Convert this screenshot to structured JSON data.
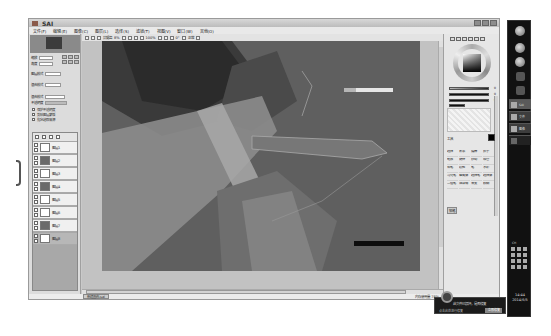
{
  "window": {
    "app_name": "SAI",
    "menu": [
      "文件(F)",
      "编辑(E)",
      "图像(C)",
      "图层(L)",
      "选择(S)",
      "滤镜(T)",
      "视图(V)",
      "窗口(W)",
      "其他(O)"
    ]
  },
  "canvas_toolbar": {
    "items": [
      "抗锯齿",
      "8%",
      "100%",
      "0°",
      "正常"
    ]
  },
  "left_panel": {
    "zoom_label": "缩放",
    "zoom_value": "100%",
    "angle_label": "角度",
    "angle_value": "0°",
    "mode_label1": "图层模式",
    "mode_value1": "正常",
    "mode_label2": "混合模式",
    "mode_value2": "正常",
    "blend_label": "混合模式",
    "blend_value": "正常",
    "opacity_label": "不透明度",
    "opacity_value": "100%",
    "checks": [
      "保护不透明度",
      "剪贴图层蒙版",
      "指定选取来源"
    ],
    "layers": [
      {
        "name": "图层1",
        "sub": "正常"
      },
      {
        "name": "图层2",
        "sub": "正常"
      },
      {
        "name": "图层3",
        "sub": "正常"
      },
      {
        "name": "图层4",
        "sub": "正常"
      },
      {
        "name": "图层5",
        "sub": "正常"
      },
      {
        "name": "图层6",
        "sub": "正常"
      },
      {
        "name": "图层7",
        "sub": "正常"
      },
      {
        "name": "图层8",
        "sub": "正常"
      }
    ]
  },
  "right_panel": {
    "slider_values": [
      "0",
      "0",
      "0"
    ],
    "tool_header": "工具",
    "tools": [
      "选择",
      "套索",
      "魔棒",
      "抓手",
      "缩放",
      "旋转",
      "移动",
      "吸管",
      "铅笔",
      "喷枪",
      "笔",
      "水彩",
      "马克笔",
      "橡皮擦",
      "选择笔",
      "选择擦",
      "二值笔",
      "油漆桶",
      "渐变",
      "模糊"
    ],
    "tag_label": "铅笔"
  },
  "status_bar": {
    "tab_label": "新建画布.sai",
    "memory": "内存使用量 78%"
  },
  "taskbar": {
    "tasks": [
      "SAI",
      "文件",
      "图像"
    ],
    "lang": "CH",
    "clock_time": "14:44",
    "clock_date": "2014/6/5"
  },
  "notification": {
    "title": "此文件已损坏，是否修复",
    "subtitle": "点击此处进行修复",
    "button": "立即修复"
  },
  "colors": {
    "canvas_bg": "#5e5e5e",
    "workspace": "#c2c2c2",
    "taskbar": "#111111"
  }
}
